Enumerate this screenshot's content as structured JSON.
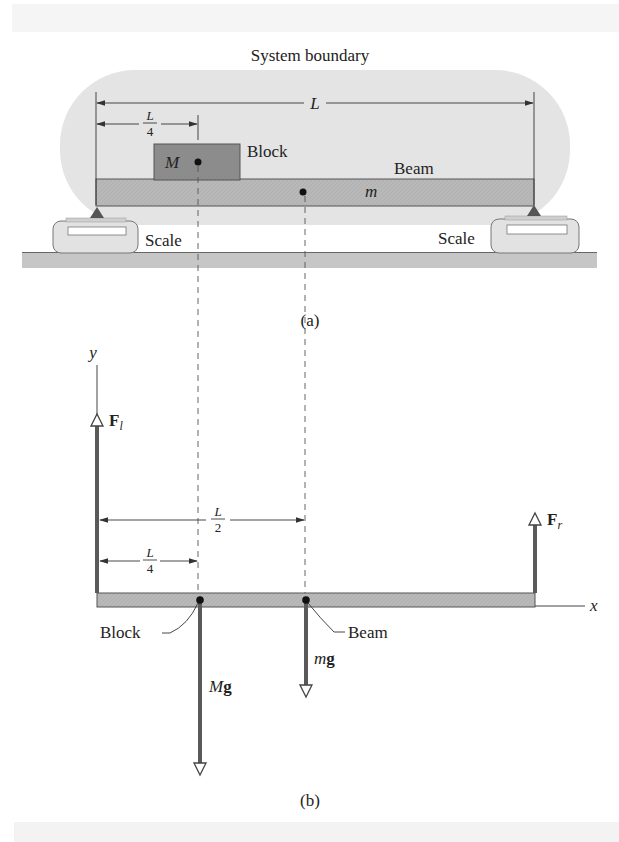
{
  "figure": {
    "part_a": {
      "caption": "(a)",
      "system_boundary_label": "System boundary",
      "dimension_total": "L",
      "dimension_quarter": {
        "num": "L",
        "den": "4"
      },
      "block": {
        "label": "Block",
        "mass_symbol": "M"
      },
      "beam": {
        "label": "Beam",
        "mass_symbol": "m"
      },
      "scales": [
        {
          "label": "Scale",
          "side": "left"
        },
        {
          "label": "Scale",
          "side": "right"
        }
      ]
    },
    "part_b": {
      "caption": "(b)",
      "axes": {
        "x": "x",
        "y": "y"
      },
      "forces": {
        "left": {
          "symbol": "F",
          "subscript": "l"
        },
        "right": {
          "symbol": "F",
          "subscript": "r"
        },
        "block_weight": {
          "mass": "M",
          "g": "g"
        },
        "beam_weight": {
          "mass": "m",
          "g": "g"
        }
      },
      "dimension_half": {
        "num": "L",
        "den": "2"
      },
      "dimension_quarter": {
        "num": "L",
        "den": "4"
      },
      "point_labels": {
        "block": "Block",
        "beam": "Beam"
      }
    },
    "colors": {
      "boundary_fill": "#e3e3e3",
      "beam_fill": "#b5b5b5",
      "block_fill": "#8a8a8a",
      "force_arrow": "#555555",
      "ground_fill": "#c4c4c4",
      "top_band": "#f4f4f4"
    }
  }
}
